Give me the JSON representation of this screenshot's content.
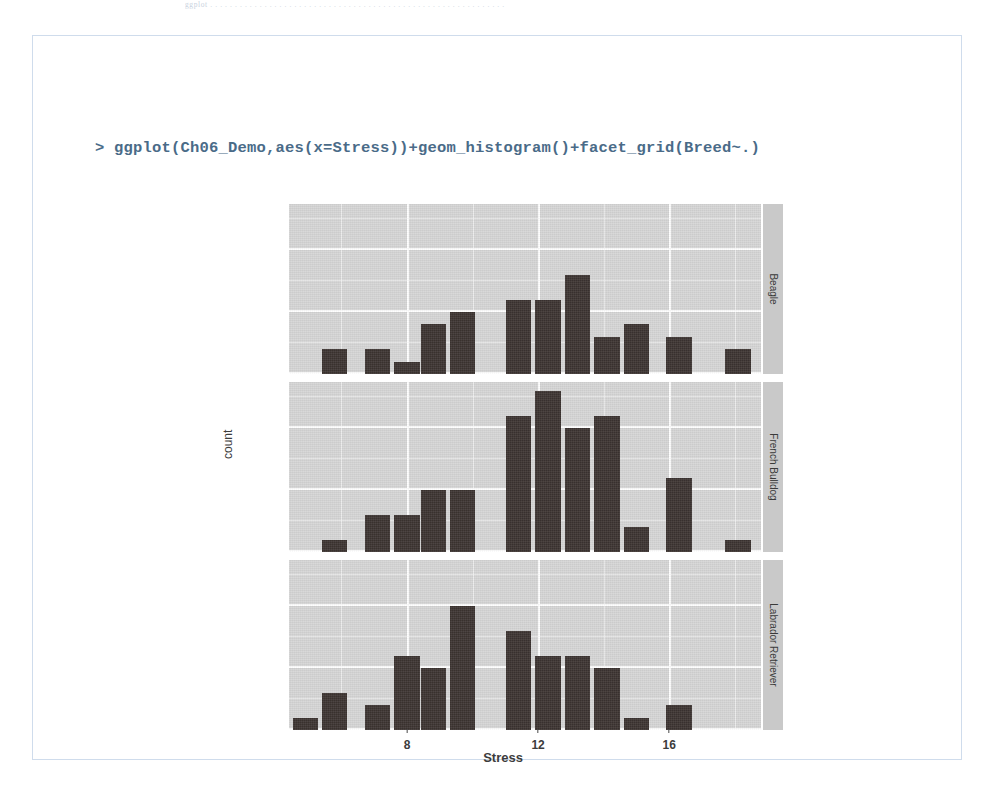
{
  "page": {
    "top_fragment": "ggplot . . . . . . . . . . . . . . . . . . . . . . . . . . . . . . . . . . . . . . . . . . . . . . . . . . . . . . . . . . . ."
  },
  "console": {
    "prompt": ">",
    "command": "> ggplot(Ch06_Demo,aes(x=Stress))+geom_histogram()+facet_grid(Breed~.)"
  },
  "colors": {
    "panel_background": "#d6d6d6",
    "strip_background": "#c9c9c9",
    "bar_fill": "#3b3330",
    "gridline": "#ffffff",
    "frame_border": "#cfdcec",
    "console_text": "#4a6b88"
  },
  "chart_data": {
    "type": "bar",
    "title": "",
    "xlabel": "Stress",
    "ylabel": "count",
    "grid": true,
    "legend": "none",
    "facet_variable": "Breed",
    "facet_direction": "rows",
    "strip_position": "right",
    "xlim": [
      4.4,
      18.8
    ],
    "ylim": [
      0,
      13.7
    ],
    "x_ticks": [
      8,
      12,
      16
    ],
    "x_tick_labels": [
      "8",
      "12",
      "16"
    ],
    "y_ticks": [
      0,
      5,
      10
    ],
    "y_tick_labels": [
      "0",
      "5",
      "10"
    ],
    "bin_width": 0.893,
    "facets": [
      {
        "label": "Beagle",
        "x": [
          5.8,
          7.1,
          8.0,
          8.8,
          9.7,
          11.4,
          12.3,
          13.2,
          14.1,
          15.0,
          16.3,
          18.1
        ],
        "values": [
          2,
          2,
          1,
          4,
          5,
          6,
          6,
          8,
          3,
          4,
          3,
          2
        ]
      },
      {
        "label": "French Bulldog",
        "x": [
          5.8,
          7.1,
          8.0,
          8.8,
          9.7,
          10.5,
          11.4,
          12.3,
          13.2,
          14.1,
          15.0,
          16.3,
          18.1
        ],
        "values": [
          1,
          3,
          3,
          5,
          5,
          0,
          11,
          13,
          10,
          11,
          2,
          6,
          1
        ]
      },
      {
        "label": "Labrador Retriever",
        "x": [
          4.9,
          5.8,
          7.1,
          8.0,
          8.8,
          9.7,
          11.4,
          12.3,
          13.2,
          14.1,
          15.0,
          16.3
        ],
        "values": [
          1,
          3,
          2,
          6,
          5,
          10,
          8,
          6,
          6,
          5,
          1,
          2
        ]
      }
    ]
  }
}
